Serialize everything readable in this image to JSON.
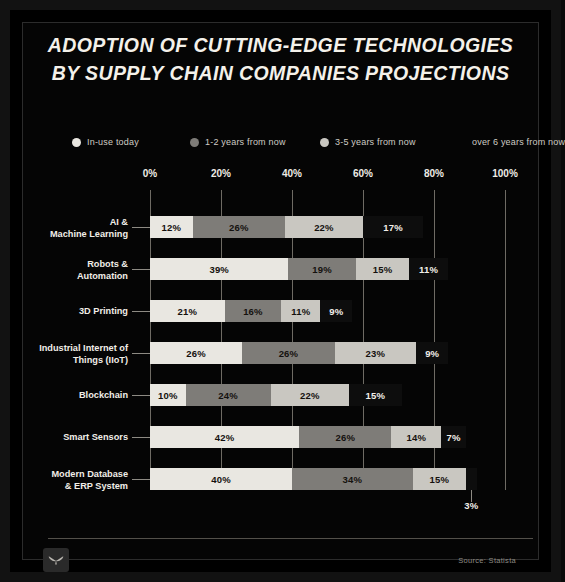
{
  "poster": {
    "title_line1": "ADOPTION OF CUTTING-EDGE TECHNOLOGIES",
    "title_line2": "BY SUPPLY CHAIN COMPANIES PROJECTIONS",
    "source": "Source: Statista",
    "logo_icon": "butterfly-logo-icon",
    "background_color": "#000000"
  },
  "chart_data": {
    "type": "bar",
    "orientation": "horizontal",
    "stacked": true,
    "title": "ADOPTION OF CUTTING-EDGE TECHNOLOGIES BY SUPPLY CHAIN COMPANIES PROJECTIONS",
    "xlabel": "",
    "ylabel": "",
    "xlim": [
      0,
      100
    ],
    "xticks": [
      "0%",
      "20%",
      "40%",
      "60%",
      "80%",
      "100%"
    ],
    "xtick_values": [
      0,
      20,
      40,
      60,
      80,
      100
    ],
    "grid": true,
    "legend_position": "top",
    "categories": [
      "AI &\nMachine Learning",
      "Robots &\nAutomation",
      "3D Printing",
      "Industrial Internet of\nThings (IIoT)",
      "Blockchain",
      "Smart Sensors",
      "Modern Database\n& ERP System"
    ],
    "series": [
      {
        "name": "In-use today",
        "color": "#e9e7e1",
        "values": [
          12,
          39,
          21,
          26,
          10,
          42,
          40
        ]
      },
      {
        "name": "1-2 years from now",
        "color": "#7e7c78",
        "values": [
          26,
          19,
          16,
          26,
          24,
          26,
          34
        ]
      },
      {
        "name": "3-5 years from now",
        "color": "#c9c7c1",
        "values": [
          22,
          15,
          11,
          23,
          22,
          14,
          15
        ]
      },
      {
        "name": "over 6 years from now",
        "color": "#0d0d0d",
        "values": [
          17,
          11,
          9,
          9,
          15,
          7,
          3
        ]
      }
    ]
  },
  "rows": [
    {
      "label_line1": "AI &",
      "label_line2": "Machine Learning",
      "values": [
        12,
        26,
        22,
        17
      ],
      "labels": [
        "12%",
        "26%",
        "22%",
        "17%"
      ]
    },
    {
      "label_line1": "Robots &",
      "label_line2": "Automation",
      "values": [
        39,
        19,
        15,
        11
      ],
      "labels": [
        "39%",
        "19%",
        "15%",
        "11%"
      ]
    },
    {
      "label_line1": "3D Printing",
      "label_line2": "",
      "values": [
        21,
        16,
        11,
        9
      ],
      "labels": [
        "21%",
        "16%",
        "11%",
        "9%"
      ]
    },
    {
      "label_line1": "Industrial Internet of",
      "label_line2": "Things (IIoT)",
      "values": [
        26,
        26,
        23,
        9
      ],
      "labels": [
        "26%",
        "26%",
        "23%",
        "9%"
      ]
    },
    {
      "label_line1": "Blockchain",
      "label_line2": "",
      "values": [
        10,
        24,
        22,
        15
      ],
      "labels": [
        "10%",
        "24%",
        "22%",
        "15%"
      ]
    },
    {
      "label_line1": "Smart Sensors",
      "label_line2": "",
      "values": [
        42,
        26,
        14,
        7
      ],
      "labels": [
        "42%",
        "26%",
        "14%",
        "7%"
      ]
    },
    {
      "label_line1": "Modern Database",
      "label_line2": "& ERP System",
      "values": [
        40,
        34,
        15,
        3
      ],
      "labels": [
        "40%",
        "34%",
        "15%",
        "3%"
      ]
    }
  ]
}
